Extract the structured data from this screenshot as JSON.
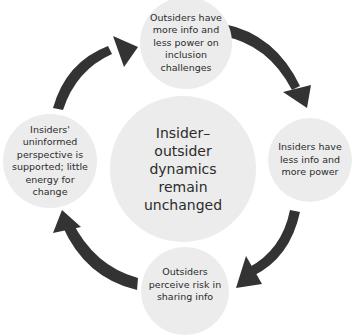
{
  "diagram": {
    "type": "cycle",
    "center": {
      "label": "Insider–\noutsider\ndynamics\nremain\nunchanged"
    },
    "nodes": [
      {
        "position": "top",
        "label": "Outsiders have more info and less power on inclusion challenges"
      },
      {
        "position": "right",
        "label": "Insiders have less info and more power"
      },
      {
        "position": "bottom",
        "label": "Outsiders perceive risk in sharing info"
      },
      {
        "position": "left",
        "label": "Insiders' uninformed perspective is supported; little energy for change"
      }
    ],
    "arrows": [
      {
        "from": "top",
        "to": "right",
        "direction": "clockwise"
      },
      {
        "from": "right",
        "to": "bottom",
        "direction": "clockwise"
      },
      {
        "from": "bottom",
        "to": "left",
        "direction": "clockwise"
      },
      {
        "from": "left",
        "to": "top",
        "direction": "clockwise"
      }
    ],
    "colors": {
      "circle_fill": "#ececec",
      "arrow_fill": "#333333",
      "text": "#2b2b2b",
      "background": "#ffffff"
    }
  }
}
